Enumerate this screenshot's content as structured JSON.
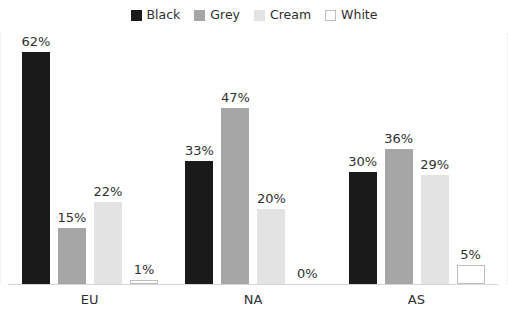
{
  "chart_data": {
    "type": "bar",
    "title": "",
    "subtitle": "",
    "xlabel": "",
    "ylabel": "",
    "grid": false,
    "legend_position": "top-center",
    "value_suffix": "%",
    "ylim": [
      0,
      62
    ],
    "categories": [
      "EU",
      "NA",
      "AS"
    ],
    "series": [
      {
        "name": "Black",
        "color": "#1a1a1a",
        "swatch_style": "filled",
        "values": [
          62,
          33,
          30
        ],
        "labels": [
          "62%",
          "33%",
          "30%"
        ]
      },
      {
        "name": "Grey",
        "color": "#a6a6a6",
        "swatch_style": "filled",
        "values": [
          15,
          47,
          36
        ],
        "labels": [
          "15%",
          "47%",
          "36%"
        ]
      },
      {
        "name": "Cream",
        "color": "#e3e3e3",
        "swatch_style": "filled",
        "values": [
          22,
          20,
          29
        ],
        "labels": [
          "22%",
          "20%",
          "29%"
        ]
      },
      {
        "name": "White",
        "color": "#ffffff",
        "swatch_style": "outlined",
        "border_color": "#bdbdbd",
        "values": [
          1,
          0,
          5
        ],
        "labels": [
          "1%",
          "0%",
          "5%"
        ]
      }
    ]
  },
  "legend": {
    "items": [
      {
        "label": "Black"
      },
      {
        "label": "Grey"
      },
      {
        "label": "Cream"
      },
      {
        "label": "White"
      }
    ]
  },
  "axis": {
    "categories": [
      {
        "label": "EU"
      },
      {
        "label": "NA"
      },
      {
        "label": "AS"
      }
    ]
  }
}
